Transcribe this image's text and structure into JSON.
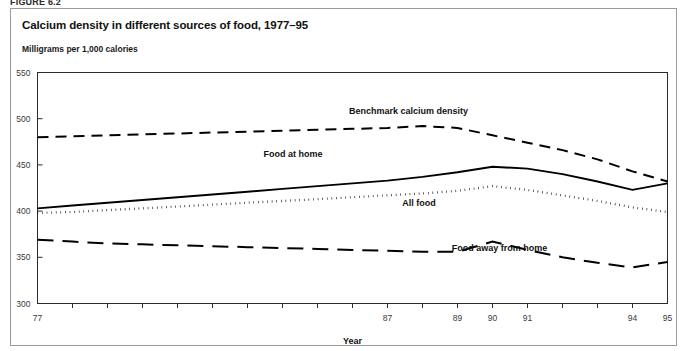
{
  "figure": {
    "number_label": "FIGURE 6.2",
    "title": "Calcium density in different sources of food, 1977–95",
    "unit_label": "Milligrams per 1,000 calories"
  },
  "chart_data": {
    "type": "line",
    "title": "Calcium density in different sources of food, 1977–95",
    "subtitle": "Milligrams per 1,000 calories",
    "xlabel": "Year",
    "ylabel": "Milligrams per 1,000 calories",
    "ylim": [
      300,
      550
    ],
    "ytick_labels": [
      "300",
      "350",
      "400",
      "450",
      "500",
      "550"
    ],
    "ytick_values": [
      300,
      350,
      400,
      450,
      500,
      550
    ],
    "grid": false,
    "legend_position": "inline-annotations",
    "x": [
      1977,
      1978,
      1979,
      1980,
      1981,
      1982,
      1983,
      1984,
      1985,
      1986,
      1987,
      1988,
      1989,
      1990,
      1991,
      1992,
      1993,
      1994,
      1995
    ],
    "xtick_labels": [
      "77",
      "",
      "",
      "",
      "",
      "",
      "",
      "",
      "",
      "",
      "87",
      "",
      "89",
      "90",
      "91",
      "",
      "",
      "94",
      "95"
    ],
    "xtick_labels_shown": [
      "77",
      "87",
      "89",
      "90",
      "91",
      "94",
      "95"
    ],
    "series": [
      {
        "name": "Benchmark calcium density",
        "label": "Benchmark calcium density",
        "style": "dashed",
        "label_x": 1987.6,
        "label_y": 505,
        "values": [
          480,
          481,
          482,
          483,
          484,
          485,
          486,
          487,
          488,
          489,
          490,
          492,
          490,
          482,
          474,
          466,
          456,
          443,
          432
        ]
      },
      {
        "name": "Food at home",
        "label": "Food at home",
        "style": "solid",
        "label_x": 1984.3,
        "label_y": 459,
        "values": [
          403,
          406,
          409,
          412,
          415,
          418,
          421,
          424,
          427,
          430,
          433,
          437,
          442,
          448,
          446,
          440,
          432,
          423,
          430
        ]
      },
      {
        "name": "All food",
        "label": "All food",
        "style": "dotted",
        "label_x": 1987.9,
        "label_y": 406,
        "values": [
          398,
          399,
          401,
          403,
          405,
          407,
          409,
          411,
          413,
          415,
          417,
          419,
          422,
          427,
          423,
          417,
          411,
          404,
          399
        ]
      },
      {
        "name": "Food away from home",
        "label": "Food away from home",
        "style": "long-dashed",
        "label_x": 1990.2,
        "label_y": 357,
        "values": [
          369,
          367,
          365,
          364,
          363,
          362,
          361,
          360,
          359,
          358,
          357,
          356,
          356,
          367,
          358,
          350,
          344,
          339,
          345
        ]
      }
    ]
  }
}
